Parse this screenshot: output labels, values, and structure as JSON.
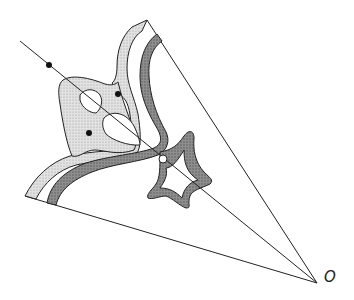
{
  "diagram": {
    "point_label": "O",
    "colors": {
      "stroke": "#222222",
      "light_fill": "#d4d4d4",
      "dark_fill": "#8a8a8a",
      "background": "#ffffff"
    },
    "elements": [
      "ray-upper-boundary",
      "ray-lower-boundary",
      "central-line",
      "outer-light-band",
      "inner-dark-band",
      "shaded-lobe-region",
      "star-shaped-region",
      "small-holes",
      "black-dots",
      "open-circle-point"
    ]
  }
}
